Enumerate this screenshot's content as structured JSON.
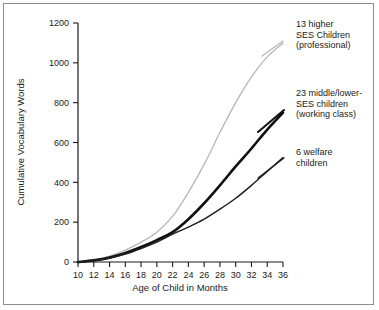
{
  "chart_data": {
    "type": "line",
    "title": "",
    "xlabel": "Age of Child in Months",
    "ylabel": "Cumulative Vocabulary Words",
    "xlim": [
      10,
      36
    ],
    "ylim": [
      0,
      1200
    ],
    "xticks": [
      10,
      12,
      14,
      16,
      18,
      20,
      22,
      24,
      26,
      28,
      30,
      32,
      34,
      36
    ],
    "yticks": [
      0,
      200,
      400,
      600,
      800,
      1000,
      1200
    ],
    "xtick_labels": [
      "10",
      "12",
      "14",
      "16",
      "18",
      "20",
      "22",
      "24",
      "26",
      "28",
      "30",
      "32",
      "34",
      "36"
    ],
    "ytick_labels": [
      "0",
      "200",
      "400",
      "600",
      "800",
      "1000",
      "1200"
    ],
    "grid": false,
    "legend_position": "right-inline-annotations",
    "x": [
      10,
      12,
      14,
      16,
      18,
      20,
      22,
      24,
      26,
      28,
      30,
      32,
      34,
      36
    ],
    "series": [
      {
        "name": "13 higher SES Children (professional)",
        "color": "#b6b6b6",
        "line_width": 1.3,
        "values": [
          0,
          10,
          30,
          60,
          100,
          150,
          230,
          350,
          490,
          650,
          800,
          930,
          1030,
          1100
        ]
      },
      {
        "name": "23 middle/lower-SES children (working class)",
        "color": "#101010",
        "line_width": 2.6,
        "values": [
          0,
          8,
          22,
          45,
          75,
          110,
          150,
          215,
          295,
          385,
          480,
          570,
          665,
          750
        ]
      },
      {
        "name": "6 welfare children",
        "color": "#202020",
        "line_width": 1.5,
        "values": [
          0,
          8,
          20,
          40,
          68,
          100,
          140,
          175,
          215,
          265,
          320,
          385,
          455,
          525
        ]
      }
    ],
    "annotations": [
      {
        "id": "professional",
        "lines": [
          "13 higher",
          "SES Children",
          "(professional)"
        ],
        "x": 296,
        "y": 27
      },
      {
        "id": "working-class",
        "lines": [
          "23 middle/lower-",
          "SES children",
          "(working class)"
        ],
        "x": 296,
        "y": 96
      },
      {
        "id": "welfare",
        "lines": [
          "6 welfare",
          "children"
        ],
        "x": 296,
        "y": 155
      }
    ]
  },
  "colors": {
    "frame": "#8d8d8d",
    "axis": "#1a1a1a",
    "background": "#ffffff",
    "professional": "#b6b6b6",
    "working_class": "#101010",
    "welfare": "#202020"
  }
}
